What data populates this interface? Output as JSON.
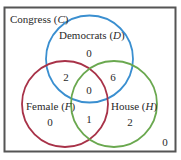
{
  "diagram": {
    "type": "venn",
    "universe": {
      "label": "Congress",
      "symbol": "C",
      "outside_count": "0"
    },
    "sets": [
      {
        "id": "D",
        "label": "Democrats",
        "symbol": "D",
        "color": "#3a8fd0"
      },
      {
        "id": "F",
        "label": "Female",
        "symbol": "F",
        "color": "#a83248"
      },
      {
        "id": "H",
        "label": "House",
        "symbol": "H",
        "color": "#6aa84f"
      }
    ],
    "regions": {
      "D_only": "0",
      "D_and_F_only": "2",
      "D_and_H_only": "6",
      "D_and_F_and_H": "0",
      "F_only": "0",
      "F_and_H_only": "1",
      "H_only": "2",
      "outside": "0"
    },
    "colors": {
      "frame": "#555555",
      "text": "#2a2a2a"
    }
  }
}
